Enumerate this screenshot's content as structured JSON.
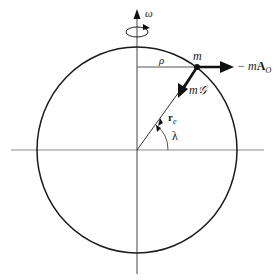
{
  "diagram": {
    "type": "earth-rotating-frame-free-body-diagram",
    "labels": {
      "omega": "ω",
      "rho": "ρ",
      "mass": "m",
      "gravity_force": "m𝒢",
      "inertial_force_prefix": "− m",
      "inertial_force_vector": "A",
      "inertial_force_subscript": "O",
      "radius_vector": "r",
      "radius_subscript": "e",
      "latitude": "λ"
    },
    "colors": {
      "circle": "#1a1a1a",
      "axes": "#8a8a8a",
      "vectors": "#111111",
      "background": "#ffffff"
    }
  }
}
